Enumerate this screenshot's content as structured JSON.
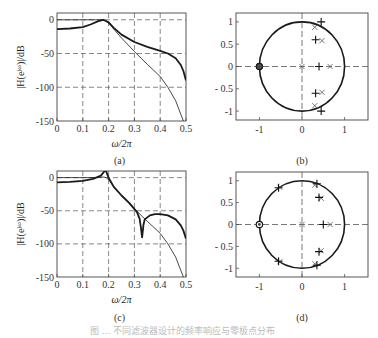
{
  "figure": {
    "caption": "图 ... 不同滤波器设计的频率响应与零极点分布",
    "panels": [
      "(a)",
      "(b)",
      "(c)",
      "(d)"
    ]
  },
  "chart_data": [
    {
      "id": "a",
      "type": "line",
      "panel_label": "(a)",
      "title": "",
      "xlabel": "ω/2π",
      "ylabel": "|H(e^{jω})|/dB",
      "xlim": [
        0,
        0.5
      ],
      "ylim": [
        -150,
        10
      ],
      "xticks": [
        0,
        0.1,
        0.2,
        0.3,
        0.4,
        0.5
      ],
      "xtick_labels": [
        "0",
        "0.1",
        "0.2",
        "0.3",
        "0.4",
        "0.5"
      ],
      "yticks": [
        0,
        -50,
        -100,
        -150
      ],
      "ytick_labels": [
        "0",
        "-50",
        "-100",
        "-150"
      ],
      "grid": "dashed",
      "series": [
        {
          "name": "filter-1 (thick)",
          "width": 1.8,
          "x": [
            0,
            0.05,
            0.1,
            0.13,
            0.16,
            0.18,
            0.2,
            0.22,
            0.25,
            0.3,
            0.35,
            0.4,
            0.43,
            0.46,
            0.48,
            0.49,
            0.5
          ],
          "y": [
            -14,
            -13,
            -11,
            -7,
            -2,
            0,
            -4,
            -12,
            -22,
            -33,
            -40,
            -46,
            -50,
            -57,
            -67,
            -76,
            -90
          ]
        },
        {
          "name": "filter-1 reference (thin)",
          "width": 0.8,
          "x": [
            0,
            0.1,
            0.15,
            0.18,
            0.2,
            0.22,
            0.25,
            0.3,
            0.35,
            0.4,
            0.43,
            0.46,
            0.48,
            0.49
          ],
          "y": [
            0,
            0,
            0,
            0,
            -3,
            -14,
            -27,
            -47,
            -66,
            -84,
            -100,
            -120,
            -140,
            -150
          ]
        }
      ]
    },
    {
      "id": "b",
      "type": "scatter",
      "panel_label": "(b)",
      "xlim": [
        -1.55,
        1.55
      ],
      "ylim": [
        -1.2,
        1.2
      ],
      "xticks": [
        -1,
        0,
        1
      ],
      "xtick_labels": [
        "-1",
        "0",
        "1"
      ],
      "yticks": [
        1,
        0.5,
        0,
        -0.5,
        -1
      ],
      "ytick_labels": [
        "1",
        "0.5",
        "0",
        "- 0.5",
        "-1"
      ],
      "unit_circle": true,
      "series": [
        {
          "name": "poles (x)",
          "marker": "x",
          "points": [
            [
              0.3,
              0.88
            ],
            [
              0.47,
              0.58
            ],
            [
              0.66,
              0
            ],
            [
              0,
              0
            ],
            [
              0.47,
              -0.58
            ],
            [
              0.3,
              -0.88
            ]
          ]
        },
        {
          "name": "poles (+)",
          "marker": "+",
          "points": [
            [
              0.45,
              1.0
            ],
            [
              0.32,
              0.6
            ],
            [
              0.4,
              0
            ],
            [
              0.32,
              -0.6
            ],
            [
              0.45,
              -1.0
            ]
          ]
        },
        {
          "name": "zeros (o)",
          "marker": "o-filled",
          "points": [
            [
              -1,
              0
            ]
          ]
        }
      ]
    },
    {
      "id": "c",
      "type": "line",
      "panel_label": "(c)",
      "xlabel": "ω/2π",
      "ylabel": "|H(e^{jω})|/dB",
      "xlim": [
        0,
        0.5
      ],
      "ylim": [
        -150,
        10
      ],
      "xticks": [
        0,
        0.1,
        0.2,
        0.3,
        0.4,
        0.5
      ],
      "xtick_labels": [
        "0",
        "0.1",
        "0.2",
        "0.3",
        "0.4",
        "0.5"
      ],
      "yticks": [
        0,
        -50,
        -100,
        -150
      ],
      "ytick_labels": [
        "0",
        "-50",
        "-100",
        "-150"
      ],
      "grid": "dashed",
      "series": [
        {
          "name": "filter-2 (thick)",
          "width": 1.8,
          "x": [
            0,
            0.05,
            0.1,
            0.14,
            0.17,
            0.185,
            0.19,
            0.2,
            0.22,
            0.25,
            0.28,
            0.31,
            0.32,
            0.325,
            0.33,
            0.335,
            0.34,
            0.36,
            0.38,
            0.4,
            0.43,
            0.46,
            0.48,
            0.49,
            0.5
          ],
          "y": [
            -7,
            -6.5,
            -5,
            -2,
            3,
            10,
            10,
            0,
            -14,
            -27,
            -38,
            -52,
            -62,
            -75,
            -90,
            -72,
            -63,
            -57,
            -55,
            -55,
            -57,
            -63,
            -72,
            -80,
            -92
          ]
        },
        {
          "name": "filter-2 reference (thin)",
          "width": 0.8,
          "x": [
            0,
            0.1,
            0.15,
            0.18,
            0.19,
            0.2,
            0.22,
            0.25,
            0.3,
            0.35,
            0.4,
            0.43,
            0.46,
            0.48,
            0.49
          ],
          "y": [
            0,
            0,
            0,
            1,
            0,
            -3,
            -14,
            -27,
            -47,
            -66,
            -84,
            -100,
            -120,
            -140,
            -150
          ]
        }
      ]
    },
    {
      "id": "d",
      "type": "scatter",
      "panel_label": "(d)",
      "xlim": [
        -1.55,
        1.55
      ],
      "ylim": [
        -1.2,
        1.2
      ],
      "xticks": [
        -1,
        0,
        1
      ],
      "xtick_labels": [
        "-1",
        "0",
        "1"
      ],
      "yticks": [
        1,
        0.5,
        0,
        -0.5,
        -1
      ],
      "ytick_labels": [
        "1",
        "0.5",
        "0",
        "- 0.5",
        "-1"
      ],
      "unit_circle": true,
      "series": [
        {
          "name": "poles (x)",
          "marker": "x",
          "points": [
            [
              0.3,
              0.9
            ],
            [
              0.45,
              0.6
            ],
            [
              0.66,
              0
            ],
            [
              0,
              0
            ],
            [
              0.45,
              -0.6
            ],
            [
              0.3,
              -0.9
            ],
            [
              -0.52,
              0.85
            ],
            [
              -0.52,
              -0.85
            ]
          ]
        },
        {
          "name": "poles (+)",
          "marker": "+",
          "points": [
            [
              0.35,
              0.93
            ],
            [
              0.4,
              0.62
            ],
            [
              0.5,
              0
            ],
            [
              0.4,
              -0.62
            ],
            [
              0.35,
              -0.93
            ],
            [
              -0.55,
              0.84
            ],
            [
              -0.55,
              -0.84
            ]
          ]
        },
        {
          "name": "zeros (o)",
          "marker": "o",
          "points": [
            [
              -1,
              0
            ]
          ]
        }
      ]
    }
  ]
}
